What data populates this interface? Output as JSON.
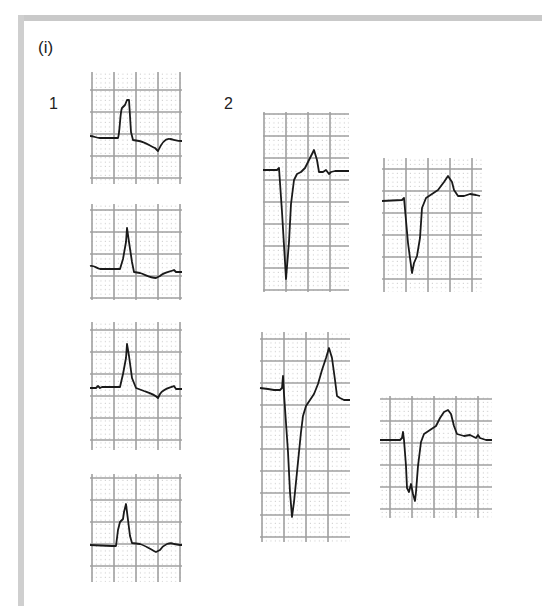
{
  "figure": {
    "part_label": "(i)",
    "groups": [
      {
        "label": "1",
        "description": "ST elevation complexes with upright R waves"
      },
      {
        "label": "2",
        "description": "ST elevation complexes with deep QS/S waves"
      }
    ]
  },
  "colors": {
    "frame": "#c9c9c9",
    "major_grid": "#9e9e9e",
    "minor_grid_dots": "#c4c4c4",
    "trace": "#1a1a1a"
  },
  "panels": [
    {
      "id": "1a",
      "group": "1",
      "x": 90,
      "y": 72,
      "w": 92,
      "h": 112,
      "cols": 4,
      "rows": 5
    },
    {
      "id": "1b",
      "group": "1",
      "x": 90,
      "y": 204,
      "w": 92,
      "h": 96,
      "cols": 4,
      "rows": 4
    },
    {
      "id": "1c",
      "group": "1",
      "x": 90,
      "y": 322,
      "w": 92,
      "h": 128,
      "cols": 4,
      "rows": 6
    },
    {
      "id": "1d",
      "group": "1",
      "x": 90,
      "y": 474,
      "w": 92,
      "h": 108,
      "cols": 4,
      "rows": 5
    },
    {
      "id": "2a",
      "group": "2",
      "x": 263,
      "y": 112,
      "w": 86,
      "h": 180,
      "cols": 4,
      "rows": 8
    },
    {
      "id": "2b",
      "group": "2",
      "x": 382,
      "y": 158,
      "w": 100,
      "h": 134,
      "cols": 4,
      "rows": 6
    },
    {
      "id": "2c",
      "group": "2",
      "x": 260,
      "y": 332,
      "w": 90,
      "h": 210,
      "cols": 4,
      "rows": 9
    },
    {
      "id": "2d",
      "group": "2",
      "x": 380,
      "y": 396,
      "w": 112,
      "h": 122,
      "cols": 5,
      "rows": 5
    }
  ]
}
